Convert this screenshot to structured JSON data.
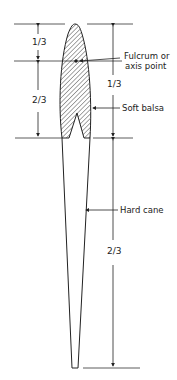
{
  "diagram": {
    "type": "technical-drawing",
    "colors": {
      "line": "#222222",
      "background": "#ffffff"
    }
  },
  "labels": {
    "fulcrum_line1": "Fulcrum or",
    "fulcrum_line2": "axis point",
    "soft_balsa": "Soft balsa",
    "hard_cane": "Hard cane"
  },
  "dimensions": {
    "left_upper": "1/3",
    "left_lower": "2/3",
    "right_upper": "1/3",
    "right_lower": "2/3"
  }
}
